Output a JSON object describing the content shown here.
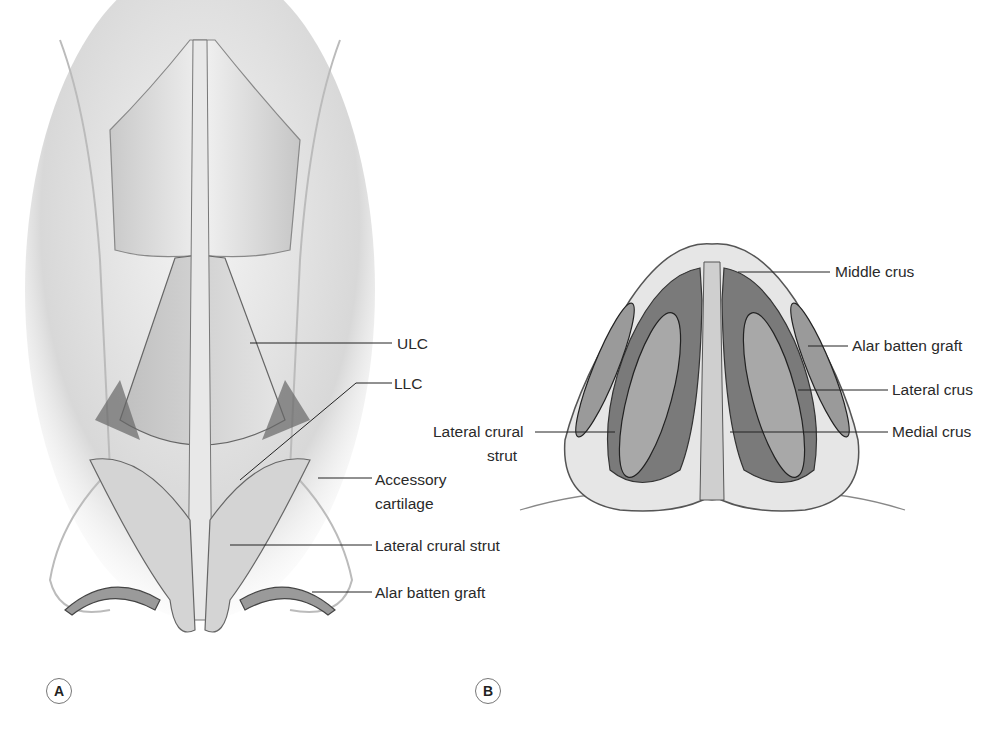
{
  "panels": [
    {
      "letter": "A",
      "view": "frontal",
      "labels": [
        {
          "text": "ULC",
          "x": 397,
          "y": 342
        },
        {
          "text": "LLC",
          "x": 394,
          "y": 382
        },
        {
          "text": "Accessory",
          "x": 375,
          "y": 470
        },
        {
          "text": "cartilage",
          "x": 375,
          "y": 496
        },
        {
          "text": "Lateral crural strut",
          "x": 375,
          "y": 538
        },
        {
          "text": "Alar batten graft",
          "x": 375,
          "y": 582
        }
      ]
    },
    {
      "letter": "B",
      "view": "basal",
      "labels": [
        {
          "text": "Middle crus",
          "x": 835,
          "y": 262
        },
        {
          "text": "Alar batten graft",
          "x": 852,
          "y": 336
        },
        {
          "text": "Lateral crus",
          "x": 892,
          "y": 380
        },
        {
          "text": "Lateral crural",
          "x": 433,
          "y": 424
        },
        {
          "text": "strut",
          "x": 487,
          "y": 450
        },
        {
          "text": "Medial crus",
          "x": 892,
          "y": 424
        }
      ]
    }
  ]
}
